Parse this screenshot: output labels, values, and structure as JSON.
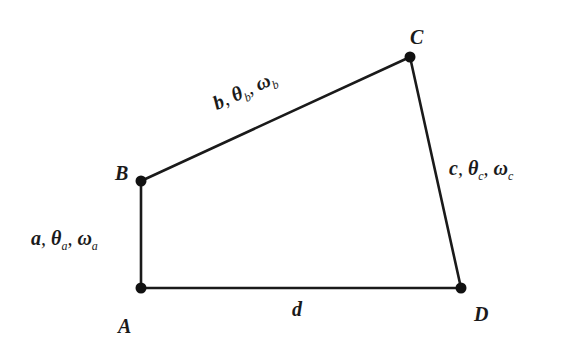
{
  "diagram": {
    "type": "four-bar-linkage",
    "colors": {
      "background": "#ffffff",
      "stroke": "#1a1a1a"
    },
    "vertices": [
      {
        "id": "A",
        "label": "A",
        "x": 141,
        "y": 288
      },
      {
        "id": "B",
        "label": "B",
        "x": 141,
        "y": 181
      },
      {
        "id": "C",
        "label": "C",
        "x": 410,
        "y": 57
      },
      {
        "id": "D",
        "label": "D",
        "x": 461,
        "y": 288
      }
    ],
    "links": [
      {
        "id": "a",
        "from": "A",
        "to": "B",
        "length": "a",
        "angle": "θ",
        "angle_sub": "a",
        "omega": "ω",
        "omega_sub": "a"
      },
      {
        "id": "b",
        "from": "B",
        "to": "C",
        "length": "b",
        "angle": "θ",
        "angle_sub": "b",
        "omega": "ω",
        "omega_sub": "b"
      },
      {
        "id": "c",
        "from": "D",
        "to": "C",
        "length": "c",
        "angle": "θ",
        "angle_sub": "c",
        "omega": "ω",
        "omega_sub": "c"
      },
      {
        "id": "d",
        "from": "A",
        "to": "D",
        "length": "d"
      }
    ],
    "separator": ", "
  }
}
